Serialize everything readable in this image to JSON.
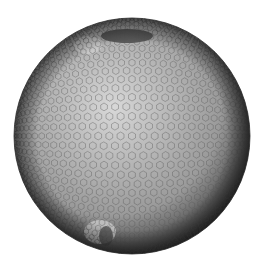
{
  "figure": {
    "subject": "Hexagonal geodesic mesh sphere",
    "background": "#ffffff",
    "sphere": {
      "cx": 132,
      "cy": 136,
      "r": 118,
      "base_color": "#9a9a9a",
      "highlight_color": "#d8d8d8",
      "shadow_color": "#3a3a3a",
      "mesh_line_color": "#5a5a5a",
      "cell_size": 4.2
    },
    "features": [
      {
        "name": "dark-patch-north",
        "cx": 127,
        "cy": 36,
        "rx": 26,
        "ry": 7,
        "color": "#3c3c3c"
      },
      {
        "name": "light-band-north",
        "cx": 88,
        "cy": 45,
        "rx": 14,
        "ry": 9,
        "color": "#cfcfcf"
      },
      {
        "name": "light-band-south",
        "cx": 100,
        "cy": 232,
        "rx": 16,
        "ry": 12,
        "color": "#cfcfcf"
      },
      {
        "name": "dark-patch-south",
        "cx": 106,
        "cy": 236,
        "rx": 7,
        "ry": 10,
        "color": "#4a4a4a"
      }
    ]
  }
}
